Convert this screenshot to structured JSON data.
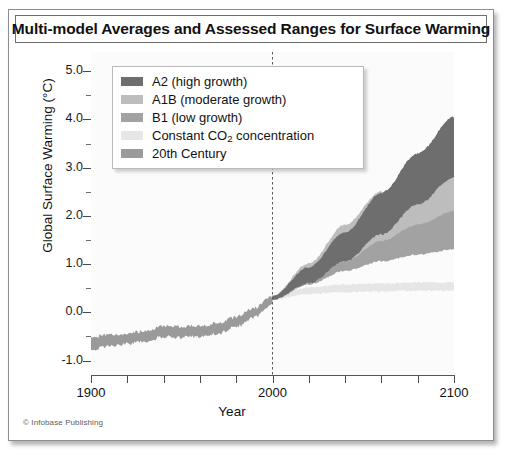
{
  "figure": {
    "title": "Multi-model Averages and Assessed Ranges for Surface Warming",
    "credit": "© Infobase Publishing"
  },
  "legend": {
    "items": [
      {
        "label": "A2 (high growth)",
        "color": "#6e6e6e",
        "icon": "legend-swatch"
      },
      {
        "label": "A1B (moderate growth)",
        "color": "#bdbdbd",
        "icon": "legend-swatch"
      },
      {
        "label": "B1 (low growth)",
        "color": "#a2a2a2",
        "icon": "legend-swatch"
      },
      {
        "label": "Constant CO2 concentration",
        "label_prefix": "Constant CO",
        "label_sub": "2",
        "label_suffix": " concentration",
        "color": "#e6e6e6",
        "icon": "legend-swatch"
      },
      {
        "label": "20th Century",
        "color": "#9a9a9a",
        "icon": "legend-swatch"
      }
    ]
  },
  "chart_data": {
    "type": "area",
    "title": "Multi-model Averages and Assessed Ranges for Surface Warming",
    "xlabel": "Year",
    "ylabel": "Global Surface Warming (°C)",
    "xlim": [
      1900,
      2100
    ],
    "ylim": [
      -1.3,
      5.4
    ],
    "xticks": [
      1900,
      1920,
      1940,
      1960,
      1980,
      2000,
      2020,
      2040,
      2060,
      2080,
      2100
    ],
    "xticklabels": [
      "1900",
      "",
      "",
      "",
      "",
      "2000",
      "",
      "",
      "",
      "",
      "2100"
    ],
    "yticks": [
      -1.0,
      0.0,
      1.0,
      2.0,
      3.0,
      4.0,
      5.0
    ],
    "yticklabels": [
      "-1.0",
      "0.0",
      "1.0",
      "2.0",
      "3.0",
      "4.0",
      "5.0"
    ],
    "yminorticks": [
      -0.5,
      0.5,
      1.5,
      2.5,
      3.5,
      4.5
    ],
    "grid": false,
    "legend_position": "upper-left-inside",
    "annotations": [
      {
        "type": "vline",
        "x": 2000,
        "style": "dashed",
        "color": "#5a5a5a",
        "label": ""
      }
    ],
    "series": [
      {
        "name": "20th Century",
        "kind": "band",
        "color": "#9a9a9a",
        "x": [
          1900,
          1910,
          1920,
          1930,
          1940,
          1950,
          1960,
          1970,
          1980,
          1990,
          2000
        ],
        "lower": [
          -0.78,
          -0.7,
          -0.66,
          -0.6,
          -0.5,
          -0.52,
          -0.5,
          -0.44,
          -0.3,
          -0.1,
          0.18
        ],
        "upper": [
          -0.52,
          -0.46,
          -0.44,
          -0.38,
          -0.28,
          -0.3,
          -0.28,
          -0.22,
          -0.1,
          0.1,
          0.34
        ]
      },
      {
        "name": "Constant CO2 concentration",
        "kind": "band",
        "color": "#e6e6e6",
        "x": [
          2000,
          2020,
          2040,
          2060,
          2080,
          2100
        ],
        "lower": [
          0.26,
          0.38,
          0.42,
          0.44,
          0.45,
          0.45
        ],
        "upper": [
          0.34,
          0.52,
          0.58,
          0.6,
          0.62,
          0.62
        ]
      },
      {
        "name": "B1 (low growth)",
        "kind": "band",
        "color": "#a2a2a2",
        "x": [
          2000,
          2020,
          2040,
          2060,
          2080,
          2100
        ],
        "lower": [
          0.26,
          0.58,
          0.86,
          1.06,
          1.2,
          1.3
        ],
        "upper": [
          0.34,
          0.92,
          1.42,
          1.8,
          2.06,
          2.22
        ]
      },
      {
        "name": "A1B (moderate growth)",
        "kind": "band",
        "color": "#bdbdbd",
        "x": [
          2000,
          2020,
          2040,
          2060,
          2080,
          2100
        ],
        "lower": [
          0.26,
          0.62,
          1.06,
          1.48,
          1.82,
          2.1
        ],
        "upper": [
          0.34,
          1.02,
          1.82,
          2.5,
          3.04,
          3.4
        ]
      },
      {
        "name": "A2 (high growth)",
        "kind": "band",
        "color": "#6e6e6e",
        "x": [
          2000,
          2020,
          2040,
          2060,
          2080,
          2100
        ],
        "lower": [
          0.26,
          0.6,
          1.06,
          1.62,
          2.24,
          2.8
        ],
        "upper": [
          0.34,
          0.94,
          1.66,
          2.48,
          3.3,
          4.05
        ]
      }
    ]
  }
}
